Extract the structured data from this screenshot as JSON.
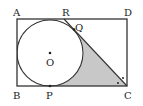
{
  "diagram": {
    "labels": {
      "A": "A",
      "B": "B",
      "C": "C",
      "D": "D",
      "O": "O",
      "P": "P",
      "Q": "Q",
      "R": "R"
    },
    "colors": {
      "stroke": "#333333",
      "shade": "#c8c8c8",
      "background": "#ffffff"
    }
  }
}
